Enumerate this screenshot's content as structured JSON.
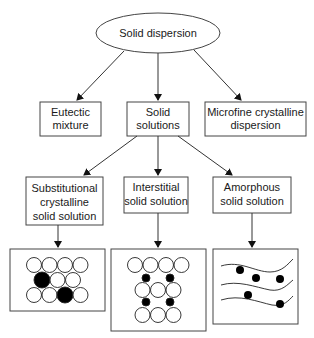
{
  "diagram": {
    "root": {
      "label": "Solid dispersion"
    },
    "level1": [
      {
        "lines": [
          "Eutectic",
          "mixture"
        ]
      },
      {
        "lines": [
          "Solid",
          "solutions"
        ]
      },
      {
        "lines": [
          "Microfine crystalline",
          "dispersion"
        ]
      }
    ],
    "level2": [
      {
        "lines": [
          "Substitutional",
          "crystalline",
          "solid solution"
        ]
      },
      {
        "lines": [
          "Interstitial",
          "solid solution"
        ]
      },
      {
        "lines": [
          "Amorphous",
          "solid solution"
        ]
      }
    ],
    "illustrations": [
      {
        "name": "substitutional-lattice",
        "description": "3 rows of white circles with 2 larger black solute circles replacing lattice sites"
      },
      {
        "name": "interstitial-lattice",
        "description": "rows of white circles with 4 small black solute circles in interstitial gaps"
      },
      {
        "name": "amorphous-structure",
        "description": "3 wavy lines with 5 black dots randomly dispersed"
      }
    ],
    "colors": {
      "line": "#333333",
      "fill_solute": "#000000",
      "fill_solvent": "#ffffff"
    }
  }
}
